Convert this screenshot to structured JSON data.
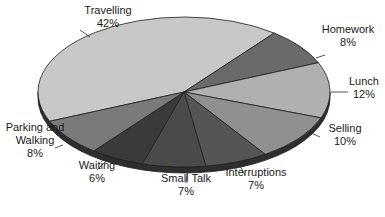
{
  "chart_data": {
    "type": "pie",
    "style": "3d-tilted",
    "title": "",
    "categories": [
      "Travelling",
      "Homework",
      "Lunch",
      "Selling",
      "Interruptions",
      "Small Talk",
      "Waiting",
      "Parking and Walking"
    ],
    "values": [
      42,
      8,
      12,
      10,
      7,
      7,
      6,
      8
    ],
    "unit": "%",
    "labels": [
      {
        "lines": [
          "Travelling",
          "42%"
        ]
      },
      {
        "lines": [
          "Homework",
          "8%"
        ]
      },
      {
        "lines": [
          "Lunch",
          "12%"
        ]
      },
      {
        "lines": [
          "Selling",
          "10%"
        ]
      },
      {
        "lines": [
          "Interruptions",
          "7%"
        ]
      },
      {
        "lines": [
          "Small Talk",
          "7%"
        ]
      },
      {
        "lines": [
          "Waiting",
          "6%"
        ]
      },
      {
        "lines": [
          "Parking and",
          "Walking",
          "8%"
        ]
      }
    ],
    "colors": [
      "#c8c8c8",
      "#6a6a6a",
      "#b0b0b0",
      "#909090",
      "#555555",
      "#4a4a4a",
      "#3a3a3a",
      "#7a7a7a"
    ],
    "legend": "none",
    "label_placement": "outside-with-leaders"
  }
}
